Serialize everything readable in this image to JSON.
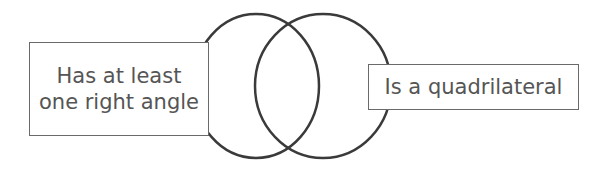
{
  "diagram": {
    "type": "venn",
    "sets": [
      {
        "label": "Has at least one right angle"
      },
      {
        "label": "Is a quadrilateral"
      }
    ],
    "colors": {
      "stroke": "#3a3a3a",
      "text": "#555555",
      "box_border": "#6a6a6a"
    }
  }
}
